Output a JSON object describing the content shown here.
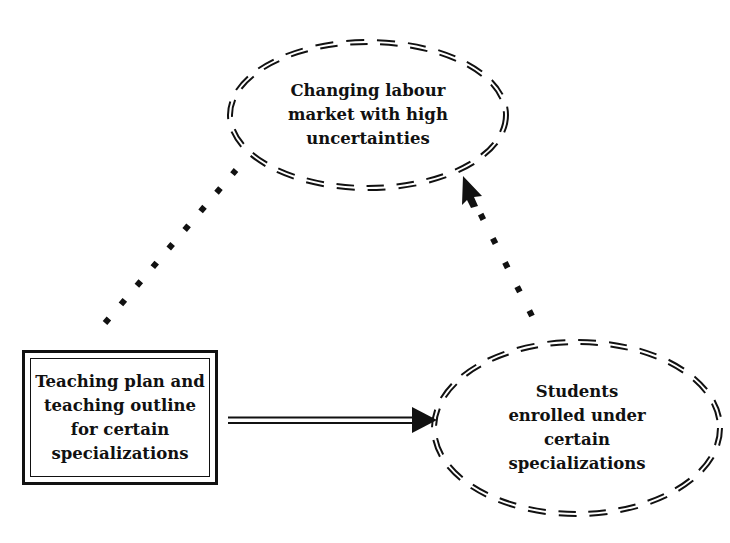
{
  "diagram": {
    "nodes": [
      {
        "id": "labour-market",
        "shape": "dashed-ellipse",
        "label": "Changing labour\nmarket with high\nuncertainties"
      },
      {
        "id": "teaching-plan",
        "shape": "double-border-rectangle",
        "label": "Teaching plan and\nteaching outline\nfor certain\nspecializations"
      },
      {
        "id": "students",
        "shape": "dashed-ellipse",
        "label": "Students\nenrolled under\ncertain\nspecializations"
      }
    ],
    "edges": [
      {
        "from": "teaching-plan",
        "to": "students",
        "style": "solid-double-arrow"
      },
      {
        "from": "teaching-plan",
        "to": "labour-market",
        "style": "dotted-no-arrow"
      },
      {
        "from": "students",
        "to": "labour-market",
        "style": "dotted-arrow"
      }
    ],
    "colors": {
      "stroke": "#111111",
      "background": "#ffffff"
    }
  }
}
